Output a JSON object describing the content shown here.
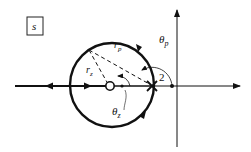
{
  "diagram": {
    "plane_label": "s",
    "labels": {
      "theta_p": "θ",
      "theta_p_sub": "p",
      "theta_z": "θ",
      "theta_z_sub": "z",
      "r_p": "r",
      "r_p_sub": "p",
      "r_z": "r",
      "r_z_sub": "z",
      "point_value": "2"
    },
    "elements": {
      "real_axis": "horizontal axis with arrow pointing right",
      "imaginary_axis": "vertical axis with arrow pointing up",
      "root_locus_circle": "circle centered near zero, passing through pole",
      "zero": "open circle on real axis",
      "pole": "X marker on real axis",
      "test_point": "filled dot on real axis near imaginary axis"
    },
    "colors": {
      "ink": "#111111",
      "background": "#ffffff"
    }
  }
}
